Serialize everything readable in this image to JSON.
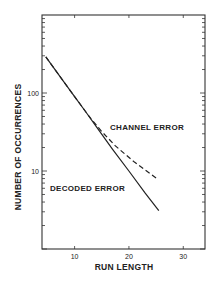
{
  "chart_data": {
    "type": "line",
    "title": "",
    "xlabel": "RUN LENGTH",
    "ylabel": "NUMBER OF OCCURRENCES",
    "xscale": "linear",
    "yscale": "log",
    "xlim": [
      4,
      34
    ],
    "ylim": [
      1,
      1000
    ],
    "x_ticks": [
      10,
      20,
      30
    ],
    "x_tick_labels": [
      "10",
      "20",
      "30"
    ],
    "y_ticks": [
      10,
      100
    ],
    "y_tick_labels": [
      "10",
      "100"
    ],
    "grid": false,
    "legend": "inline labels",
    "series": [
      {
        "name": "CHANNEL ERROR",
        "style": "dashed",
        "x": [
          4.7,
          8,
          10,
          12,
          13,
          15,
          17.5,
          21,
          25
        ],
        "y": [
          290,
          140,
          90,
          58,
          47,
          32,
          21,
          13,
          8.1
        ]
      },
      {
        "name": "DECODED ERROR",
        "style": "solid",
        "x": [
          4.7,
          8,
          10,
          12,
          14,
          17,
          20,
          23,
          25.5
        ],
        "y": [
          290,
          140,
          90,
          58,
          37,
          19,
          10,
          5.2,
          3.1
        ]
      }
    ],
    "annotations": [
      {
        "text": "CHANNEL ERROR",
        "near_series": "CHANNEL ERROR"
      },
      {
        "text": "DECODED ERROR",
        "near_series": "DECODED ERROR"
      }
    ]
  }
}
